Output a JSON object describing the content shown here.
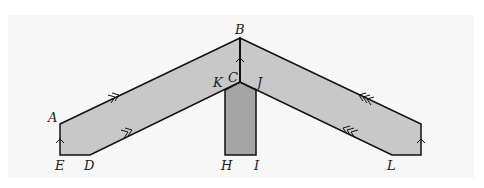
{
  "diagram": {
    "type": "geometry-figure",
    "colors": {
      "band_fill": "#c8c8c8",
      "post_fill": "#a4a4a4",
      "stroke": "#111111",
      "panel_bg": "#f7f7f7"
    },
    "points": {
      "A": {
        "label": "A",
        "x": 60,
        "y": 124
      },
      "B": {
        "label": "B",
        "x": 240,
        "y": 38
      },
      "C": {
        "label": "C",
        "x": 240,
        "y": 82
      },
      "D": {
        "label": "D",
        "x": 90,
        "y": 155
      },
      "E": {
        "label": "E",
        "x": 60,
        "y": 155
      },
      "H": {
        "label": "H",
        "x": 225,
        "y": 155
      },
      "I": {
        "label": "I",
        "x": 256,
        "y": 155
      },
      "J": {
        "label": "J",
        "x": 256,
        "y": 90
      },
      "K": {
        "label": "K",
        "x": 225,
        "y": 90
      },
      "L": {
        "label": "L",
        "x": 392,
        "y": 155
      }
    },
    "labels": [
      "A",
      "B",
      "C",
      "D",
      "E",
      "H",
      "I",
      "J",
      "K",
      "L"
    ],
    "edge_marks": {
      "single_arrow": [
        "AE",
        "BC",
        "right-end vertical"
      ],
      "double_arrow": [
        "AB",
        "DC"
      ],
      "triple_arrow": [
        "B to right end",
        "C to L"
      ]
    }
  }
}
